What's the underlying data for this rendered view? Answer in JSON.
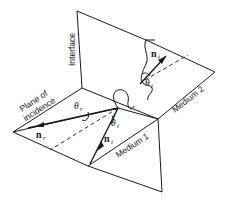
{
  "diagram": {
    "type": "geometry-optics",
    "labels": {
      "interface": "Interface",
      "plane_of_incidence_line1": "Plane of",
      "plane_of_incidence_line2": "incidence",
      "medium1": "Medium 1",
      "medium2": "Medium 2"
    },
    "vectors": {
      "incident": {
        "symbol": "n",
        "subscript": "i"
      },
      "reflected": {
        "symbol": "n",
        "subscript": "r"
      },
      "transmitted": {
        "symbol": "n",
        "subscript": "t"
      }
    },
    "angles": {
      "incident": {
        "symbol": "θ",
        "subscript": "i"
      },
      "reflected": {
        "symbol": "θ",
        "subscript": "r"
      },
      "transmitted": {
        "symbol": "θ",
        "subscript": "t"
      }
    },
    "colors": {
      "ink": "#1a1a1a",
      "background": "#ffffff"
    }
  }
}
